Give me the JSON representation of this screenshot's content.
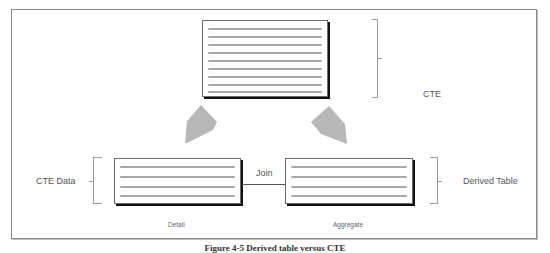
{
  "diagram": {
    "labels": {
      "cte": "CTE",
      "cte_data": "CTE Data",
      "derived_table": "Derived Table",
      "join": "Join",
      "detail": "Detail",
      "aggregate": "Aggregate"
    },
    "tables": [
      {
        "id": "top",
        "line_count": 9
      },
      {
        "id": "detail",
        "line_count": 4
      },
      {
        "id": "aggregate",
        "line_count": 4
      }
    ],
    "arrows": [
      {
        "from": "top",
        "to": "detail",
        "color": "#b8b8b8"
      },
      {
        "from": "top",
        "to": "aggregate",
        "color": "#b8b8b8"
      }
    ],
    "colors": {
      "frame": "#8a8a8a",
      "table_border": "#6c6c6c",
      "table_line": "#a8a8a8",
      "arrow": "#b8b8b8"
    }
  },
  "caption": "Figure 4-5 Derived table versus CTE"
}
